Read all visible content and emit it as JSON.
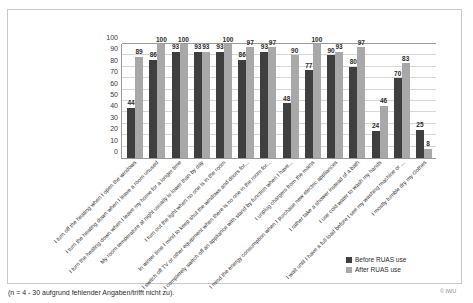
{
  "page": {
    "ghost_top_text": "",
    "caption": "(n = 4 - 30 aufgrund fehlender Angaben/trifft nicht zu).",
    "copyright": "© IWU"
  },
  "legend": {
    "position": "bottom-right",
    "entries": [
      {
        "label": "Before RUAS use",
        "color": "#3f3f3f"
      },
      {
        "label": "After RUAS use",
        "color": "#a8a8a8"
      }
    ]
  },
  "chart_data": {
    "type": "bar",
    "title": "",
    "subtitle": "",
    "xlabel": "",
    "ylabel": "",
    "ylim": [
      0,
      100
    ],
    "yticks": [
      100,
      90,
      80,
      70,
      60,
      50,
      40,
      30,
      20,
      10,
      0
    ],
    "grid": true,
    "legend_position": "bottom-right",
    "categories": [
      "I turn off the heating when I open the windows",
      "I turn the heating down when I leave a room unused",
      "I turn the heating down when I leave my home for a longer time",
      "My room temperature at night usually is lower than by day",
      "I turn out the light when no one is in the room",
      "In winter time I mind to keep shut the windows and doors for...",
      "I switch off TV or other equipment when there is no one in the room for...",
      "I completely switch off an appliance with stand by function when I have...",
      "I unplug chargers from the mains",
      "I mind the energy consumption when I purchase new electric appliances",
      "I rather take a shower instead of a bath",
      "I use cold water to wash my hands",
      "I wait until I have a full load before I see my washing machine or ...",
      "I mostly tumble dry my clothes"
    ],
    "series": [
      {
        "name": "Before RUAS use",
        "color": "#3f3f3f",
        "values": [
          44,
          86,
          93,
          93,
          93,
          86,
          93,
          48,
          77,
          90,
          80,
          24,
          70,
          25
        ]
      },
      {
        "name": "After RUAS use",
        "color": "#a8a8a8",
        "values": [
          89,
          100,
          100,
          93,
          100,
          97,
          97,
          90,
          100,
          93,
          97,
          46,
          83,
          8
        ]
      }
    ]
  }
}
